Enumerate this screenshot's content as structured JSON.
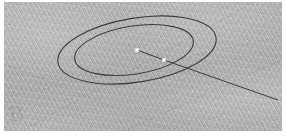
{
  "app": {
    "title": "CAD Ellipse Viewport",
    "canvas_width": 286,
    "canvas_height": 138
  },
  "viewport": {
    "name": "drawing-viewport",
    "background_color": "#adadad",
    "margin_color": "#ffffff",
    "texture": "diagonal-moire-hatch",
    "x": 4,
    "y": 2,
    "width": 278,
    "height": 129
  },
  "geometry": {
    "stroke_color": "#3d3d3d",
    "marker_color": "#ffffff",
    "outer_ellipse": {
      "name": "outer-ellipse",
      "cx": 137,
      "cy": 50,
      "rx": 80,
      "ry": 32,
      "rotation_deg": -9,
      "stroke_width": 1.1
    },
    "inner_ellipse": {
      "name": "inner-ellipse",
      "cx": 134,
      "cy": 50,
      "rx": 60,
      "ry": 24,
      "rotation_deg": -9,
      "stroke_width": 1.1
    },
    "center_point": {
      "name": "center-point-marker",
      "x": 137,
      "y": 50,
      "size": 3
    },
    "edge_point": {
      "name": "edge-point-marker",
      "x": 164,
      "y": 60,
      "size": 3
    },
    "radius_line": {
      "name": "radius-line",
      "x1": 137,
      "y1": 50,
      "x2": 164,
      "y2": 60,
      "stroke_width": 1.0
    },
    "leader_line": {
      "name": "leader-line",
      "x1": 164,
      "y1": 60,
      "x2": 278,
      "y2": 100,
      "stroke_width": 1.0
    }
  },
  "watermark": {
    "name": "corner-watermark",
    "glyph": "B",
    "x": 10,
    "y": 108,
    "opacity": 0.16,
    "color": "#555555"
  }
}
